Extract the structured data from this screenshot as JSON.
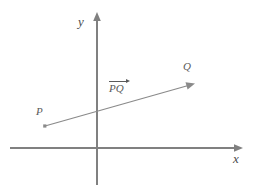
{
  "figure": {
    "kind": "vector-diagram",
    "background_color": "#ffffff",
    "axis_color": "#808080",
    "vector_color": "#8a8a8a",
    "label_color": "#5a5a5a"
  },
  "axes": {
    "x_label": "x",
    "y_label": "y",
    "origin": {
      "x": 97,
      "y": 148
    },
    "x_axis": {
      "start_x": 10,
      "end_x": 242,
      "y": 148,
      "arrow": "right"
    },
    "y_axis": {
      "x": 97,
      "start_y": 185,
      "end_y": 13,
      "arrow": "up"
    }
  },
  "vector": {
    "label": "PQ",
    "overbar": "arrow-right",
    "tail_label": "P",
    "head_label": "Q",
    "tail_point": {
      "x": 45,
      "y": 126
    },
    "head_point": {
      "x": 194,
      "y": 84
    }
  }
}
